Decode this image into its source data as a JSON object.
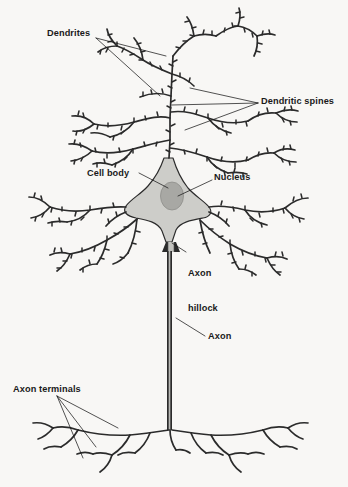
{
  "figure": {
    "background_color": "#f8f7f5",
    "ink_color": "#2b2b2b",
    "soma_fill": "#cdcdc9",
    "nucleus_fill": "#a8a8a4",
    "label_color": "#1a1a1a"
  },
  "labels": {
    "dendrites": "Dendrites",
    "dendritic_spines": "Dendritic spines",
    "cell_body": "Cell body",
    "nucleus": "Nucleus",
    "axon_hillock_line1": "Axon",
    "axon_hillock_line2": "hillock",
    "axon": "Axon",
    "axon_terminals": "Axon terminals"
  }
}
